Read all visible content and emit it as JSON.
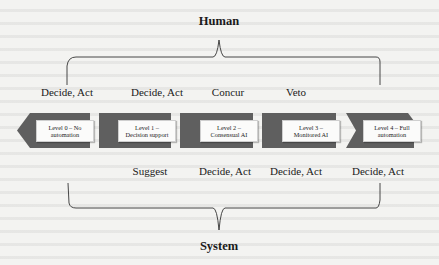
{
  "diagram": {
    "top_title": "Human",
    "bottom_title": "System",
    "human_roles": [
      {
        "label": "Decide, Act"
      },
      {
        "label": "Decide, Act"
      },
      {
        "label": "Concur"
      },
      {
        "label": "Veto"
      }
    ],
    "levels": [
      {
        "line1": "Level 0 – No",
        "line2": "automation"
      },
      {
        "line1": "Level 1 –",
        "line2": "Decision support"
      },
      {
        "line1": "Level 2 –",
        "line2": "Consensual AI"
      },
      {
        "line1": "Level 3 –",
        "line2": "Monitored AI"
      },
      {
        "line1": "Level 4 – Full",
        "line2": "automation"
      }
    ],
    "system_roles": [
      {
        "label": "Suggest"
      },
      {
        "label": "Decide, Act"
      },
      {
        "label": "Decide, Act"
      },
      {
        "label": "Decide, Act"
      }
    ],
    "colors": {
      "band": "#5f5f5f",
      "box_fill": "#fbfbfa",
      "line": "#333333"
    }
  }
}
